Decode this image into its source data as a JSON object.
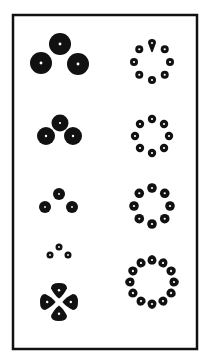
{
  "figure": {
    "background": "#ffffff",
    "ink": "#111111",
    "frame": {
      "x": 13,
      "y": 15,
      "width": 184,
      "height": 334,
      "stroke_width": 2.5
    },
    "left_column": [
      {
        "name": "trio-large",
        "dots": [
          {
            "cx": 60,
            "cy": 44,
            "r": 11
          },
          {
            "cx": 41,
            "cy": 63,
            "r": 11
          },
          {
            "cx": 78,
            "cy": 64,
            "r": 11
          }
        ]
      },
      {
        "name": "trio-touching",
        "dots": [
          {
            "cx": 60,
            "cy": 123,
            "r": 8.5
          },
          {
            "cx": 46,
            "cy": 136,
            "r": 9
          },
          {
            "cx": 73,
            "cy": 136,
            "r": 9
          }
        ]
      },
      {
        "name": "trio-medium",
        "dots": [
          {
            "cx": 59,
            "cy": 194,
            "r": 6
          },
          {
            "cx": 45,
            "cy": 207,
            "r": 6
          },
          {
            "cx": 72,
            "cy": 207,
            "r": 6
          }
        ]
      },
      {
        "name": "trio-small",
        "dots": [
          {
            "cx": 59,
            "cy": 247,
            "r": 3.5
          },
          {
            "cx": 50,
            "cy": 255,
            "r": 3.5
          },
          {
            "cx": 68,
            "cy": 255,
            "r": 3.5
          }
        ]
      }
    ],
    "clover": {
      "cx": 59,
      "cy": 302,
      "lobes": 4,
      "lobe_offset": 11,
      "lobe_r": 8
    },
    "right_column": [
      {
        "name": "ring-8-teardrop",
        "cx": 152,
        "cy": 62,
        "radius": 18,
        "count": 8,
        "dot_r": 4,
        "teardrop_top": true
      },
      {
        "name": "ring-8-small",
        "cx": 152,
        "cy": 136,
        "radius": 17,
        "count": 8,
        "dot_r": 4.2,
        "teardrop_top": false
      },
      {
        "name": "ring-8-medium",
        "cx": 152,
        "cy": 206,
        "radius": 18,
        "count": 8,
        "dot_r": 4.8,
        "teardrop_top": false
      },
      {
        "name": "ring-12",
        "cx": 152,
        "cy": 282,
        "radius": 22,
        "count": 12,
        "dot_r": 4.5,
        "teardrop_top": false
      }
    ]
  }
}
